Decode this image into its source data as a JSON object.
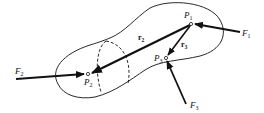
{
  "diagram": {
    "type": "free-body diagram of rigid body",
    "colors": {
      "stroke": "#111111",
      "background": "#ffffff"
    },
    "body": {
      "outline": "blob-shaped rigid body",
      "section": "dashed elliptical cross-section"
    },
    "points": [
      {
        "id": "P1",
        "label": "P",
        "sub": "1",
        "x": 191,
        "y": 24
      },
      {
        "id": "P2",
        "label": "P",
        "sub": "2",
        "x": 88,
        "y": 74
      },
      {
        "id": "P3",
        "label": "P",
        "sub": "3",
        "x": 166,
        "y": 58
      }
    ],
    "forces": [
      {
        "id": "F1",
        "label": "F",
        "sub": "1",
        "applied_at": "P1"
      },
      {
        "id": "F2",
        "label": "F",
        "sub": "2",
        "applied_at": "P2"
      },
      {
        "id": "F3",
        "label": "F",
        "sub": "3",
        "applied_at": "P3"
      }
    ],
    "position_vectors": [
      {
        "id": "r2",
        "label": "r",
        "sub": "2",
        "from": "P1",
        "to": "P2"
      },
      {
        "id": "r3",
        "label": "r",
        "sub": "3",
        "from": "P1",
        "to": "P3"
      }
    ]
  }
}
